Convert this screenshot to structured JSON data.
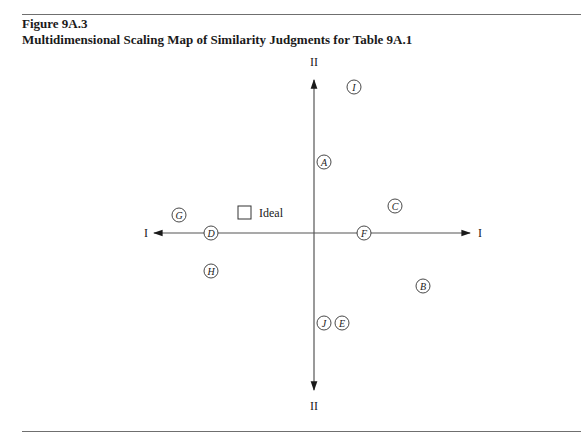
{
  "figure": {
    "label": "Figure 9A.3",
    "title": "Multidimensional Scaling Map of Similarity Judgments for Table 9A.1"
  },
  "chart_data": {
    "type": "scatter",
    "title": "Multidimensional Scaling Map of Similarity Judgments for Table 9A.1",
    "xlabel": "I",
    "ylabel": "II",
    "axes": {
      "x_left_label": "I",
      "x_right_label": "I",
      "y_top_label": "II",
      "y_bottom_label": "II",
      "grid": false,
      "ticks": false
    },
    "points": [
      {
        "label": "I",
        "x": 0.33,
        "y": 1.18,
        "px": 354,
        "py": 87
      },
      {
        "label": "A",
        "x": 0.08,
        "y": 0.57,
        "px": 324,
        "py": 162
      },
      {
        "label": "C",
        "x": 0.66,
        "y": 0.22,
        "px": 395,
        "py": 206
      },
      {
        "label": "G",
        "x": -1.11,
        "y": 0.15,
        "px": 179,
        "py": 215
      },
      {
        "label": "D",
        "x": -0.84,
        "y": 0.0,
        "px": 211,
        "py": 233
      },
      {
        "label": "F",
        "x": 0.41,
        "y": 0.0,
        "px": 364,
        "py": 233
      },
      {
        "label": "H",
        "x": -0.84,
        "y": -0.31,
        "px": 211,
        "py": 271
      },
      {
        "label": "B",
        "x": 0.89,
        "y": -0.43,
        "px": 423,
        "py": 286
      },
      {
        "label": "J",
        "x": 0.08,
        "y": -0.74,
        "px": 324,
        "py": 323
      },
      {
        "label": "E",
        "x": 0.23,
        "y": -0.74,
        "px": 342,
        "py": 323
      }
    ],
    "ideal_point": {
      "label": "Ideal",
      "x": -0.57,
      "y": 0.16,
      "px": 244,
      "py": 213
    }
  }
}
